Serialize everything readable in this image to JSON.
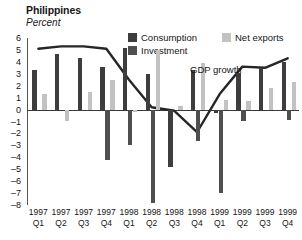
{
  "header": {
    "title": "Philippines",
    "subtitle": "Percent"
  },
  "legend": {
    "position": "top-right",
    "items": [
      {
        "key": "consumption",
        "label": "Consumption",
        "color": "#3d3d3d"
      },
      {
        "key": "investment",
        "label": "Investment",
        "color": "#4f4f4f"
      },
      {
        "key": "net_exports",
        "label": "Net exports",
        "color": "#c2c2c2"
      }
    ]
  },
  "annotations": [
    {
      "name": "gdp-growth-label",
      "text": "GDP growth"
    }
  ],
  "axes": {
    "y": {
      "label": "Percent",
      "min": -8,
      "max": 6,
      "ticks": [
        6,
        5,
        4,
        3,
        2,
        1,
        0,
        -1,
        -2,
        -3,
        -4,
        -5,
        -6,
        -7,
        -8
      ],
      "tick_labels": [
        "6",
        "5",
        "4",
        "3",
        "2",
        "1",
        "0",
        "–1",
        "–2",
        "–3",
        "–4",
        "–5",
        "–6",
        "–7",
        "–8"
      ]
    },
    "x": {
      "years": [
        "1997",
        "1997",
        "1997",
        "1997",
        "1998",
        "1998",
        "1998",
        "1998",
        "1999",
        "1999",
        "1999",
        "1999"
      ],
      "quarters": [
        "Q1",
        "Q2",
        "Q3",
        "Q4",
        "Q1",
        "Q2",
        "Q3",
        "Q4",
        "Q1",
        "Q2",
        "Q3",
        "Q4"
      ]
    }
  },
  "chart_data": {
    "type": "bar",
    "title": "Philippines",
    "subtitle": "Percent",
    "xlabel": "",
    "ylabel": "Percent",
    "ylim": [
      -8,
      6
    ],
    "grid": false,
    "legend_position": "top-right",
    "categories": [
      "1997 Q1",
      "1997 Q2",
      "1997 Q3",
      "1997 Q4",
      "1998 Q1",
      "1998 Q2",
      "1998 Q3",
      "1998 Q4",
      "1999 Q1",
      "1999 Q2",
      "1999 Q3",
      "1999 Q4"
    ],
    "series": [
      {
        "name": "Consumption",
        "type": "bar",
        "color": "#3d3d3d",
        "values": [
          3.3,
          4.7,
          4.3,
          3.6,
          5.2,
          3.0,
          -4.8,
          3.3,
          -0.3,
          3.1,
          3.5,
          4.0
        ]
      },
      {
        "name": "Investment",
        "type": "bar",
        "color": "#4f4f4f",
        "values": [
          0.0,
          0.0,
          0.0,
          -4.2,
          -3.0,
          -7.8,
          0.0,
          -2.6,
          -7.0,
          -1.0,
          0.0,
          -0.9
        ]
      },
      {
        "name": "Net exports",
        "type": "bar",
        "color": "#c2c2c2",
        "values": [
          1.3,
          -1.0,
          1.5,
          2.5,
          -0.2,
          5.0,
          0.3,
          3.9,
          0.8,
          0.7,
          1.8,
          2.3
        ]
      },
      {
        "name": "GDP growth",
        "type": "line",
        "color": "#262626",
        "values": [
          5.1,
          5.3,
          5.3,
          5.1,
          2.5,
          0.2,
          -0.1,
          -1.9,
          1.3,
          3.6,
          3.5,
          4.3
        ]
      }
    ]
  }
}
